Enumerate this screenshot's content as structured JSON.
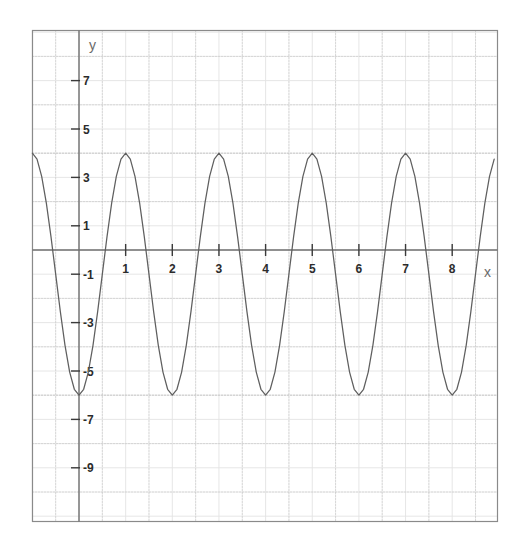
{
  "figure": {
    "title": "",
    "background_color": "#ffffff",
    "plot_border_color": "#8a8a8a",
    "axis_color": "#6f6f6f",
    "grid_minor_color": "#e3e3e3",
    "grid_major_color": "#b9b9b9",
    "curve_color": "#5f5f5f",
    "tick_label_color": "#2b2b2b",
    "axis_name_color": "#7a7a7a"
  },
  "axis_labels": {
    "x": "x",
    "y": "y"
  },
  "chart_data": {
    "type": "line",
    "title": "",
    "xlabel": "x",
    "ylabel": "y",
    "xlim": [
      -1,
      8.9
    ],
    "ylim": [
      -10.2,
      10.2
    ],
    "grid": true,
    "legend": "none",
    "function": "y = -1 + 5*cos(pi*x)",
    "amplitude": 5,
    "period": 2,
    "midline": -1,
    "maximum": 4,
    "minimum": -6,
    "x_tick_labels": [
      "1",
      "2",
      "3",
      "4",
      "5",
      "6",
      "7",
      "8"
    ],
    "x_tick_values": [
      1,
      2,
      3,
      4,
      5,
      6,
      7,
      8
    ],
    "y_tick_labels": [
      "7",
      "5",
      "3",
      "1",
      "-1",
      "-3",
      "-5",
      "-7",
      "-9"
    ],
    "y_tick_values": [
      7,
      5,
      3,
      1,
      -1,
      -3,
      -5,
      -7,
      -9
    ],
    "x": [
      -1,
      -0.9,
      -0.8,
      -0.7,
      -0.6,
      -0.5,
      -0.4,
      -0.3,
      -0.2,
      -0.1,
      0,
      0.1,
      0.2,
      0.3,
      0.4,
      0.5,
      0.6,
      0.7,
      0.8,
      0.9,
      1,
      1.1,
      1.2,
      1.3,
      1.4,
      1.5,
      1.6,
      1.7,
      1.8,
      1.9,
      2,
      2.1,
      2.2,
      2.3,
      2.4,
      2.5,
      2.6,
      2.7,
      2.8,
      2.9,
      3,
      3.1,
      3.2,
      3.3,
      3.4,
      3.5,
      3.6,
      3.7,
      3.8,
      3.9,
      4,
      4.1,
      4.2,
      4.3,
      4.4,
      4.5,
      4.6,
      4.7,
      4.8,
      4.9,
      5,
      5.1,
      5.2,
      5.3,
      5.4,
      5.5,
      5.6,
      5.7,
      5.8,
      5.9,
      6,
      6.1,
      6.2,
      6.3,
      6.4,
      6.5,
      6.6,
      6.7,
      6.8,
      6.9,
      7,
      7.1,
      7.2,
      7.3,
      7.4,
      7.5,
      7.6,
      7.7,
      7.8,
      7.9,
      8,
      8.1,
      8.2,
      8.3,
      8.4,
      8.5,
      8.6,
      8.7,
      8.8,
      8.9
    ],
    "y": [
      4,
      3.755,
      3.045,
      1.939,
      0.545,
      -1,
      -2.545,
      -3.939,
      -5.045,
      -5.755,
      -6,
      -5.755,
      -5.045,
      -3.939,
      -2.545,
      -1,
      0.545,
      1.939,
      3.045,
      3.755,
      4,
      3.755,
      3.045,
      1.939,
      0.545,
      -1,
      -2.545,
      -3.939,
      -5.045,
      -5.755,
      -6,
      -5.755,
      -5.045,
      -3.939,
      -2.545,
      -1,
      0.545,
      1.939,
      3.045,
      3.755,
      4,
      3.755,
      3.045,
      1.939,
      0.545,
      -1,
      -2.545,
      -3.939,
      -5.045,
      -5.755,
      -6,
      -5.755,
      -5.045,
      -3.939,
      -2.545,
      -1,
      0.545,
      1.939,
      3.045,
      3.755,
      4,
      3.755,
      3.045,
      1.939,
      0.545,
      -1,
      -2.545,
      -3.939,
      -5.045,
      -5.755,
      -6,
      -5.755,
      -5.045,
      -3.939,
      -2.545,
      -1,
      0.545,
      1.939,
      3.045,
      3.755,
      4,
      3.755,
      3.045,
      1.939,
      0.545,
      -1,
      -2.545,
      -3.939,
      -5.045,
      -5.755,
      -6,
      -5.755,
      -5.045,
      -3.939,
      -2.545,
      -1,
      0.545,
      1.939,
      3.045,
      3.755
    ]
  }
}
